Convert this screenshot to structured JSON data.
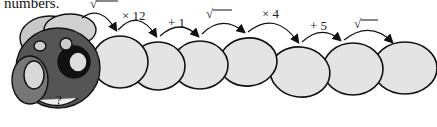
{
  "caption": "numbers.",
  "operations": [
    {
      "label": "√",
      "type": "sqrt"
    },
    {
      "label": "× 12",
      "type": "multiply"
    },
    {
      "label": "+ 1",
      "type": "add"
    },
    {
      "label": "√",
      "type": "sqrt"
    },
    {
      "label": "× 4",
      "type": "multiply"
    },
    {
      "label": "+ 5",
      "type": "add"
    },
    {
      "label": "√",
      "type": "sqrt"
    }
  ],
  "head": {
    "mark": "?"
  },
  "colors": {
    "segment_fill": "#e4e4e4",
    "outline": "#111111",
    "head_dark": "#555555",
    "head_light": "#c8c8c8"
  }
}
